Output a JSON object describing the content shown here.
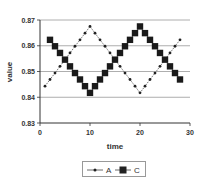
{
  "chart_data": {
    "type": "line",
    "title": "",
    "xlabel": "time",
    "ylabel": "value",
    "xlim": [
      0,
      30
    ],
    "ylim": [
      0.83,
      0.87
    ],
    "xticks": [
      0,
      10,
      20,
      30
    ],
    "yticks": [
      0.83,
      0.84,
      0.85,
      0.86,
      0.87
    ],
    "ytick_labels": [
      "0.83",
      "0.84",
      "0.85",
      "0.86",
      "0.87"
    ],
    "grid": "horizontal",
    "legend_position": "bottom",
    "series": [
      {
        "name": "A",
        "marker": "small-circle",
        "x": [
          1,
          2,
          3,
          4,
          5,
          6,
          7,
          8,
          9,
          10,
          11,
          12,
          13,
          14,
          15,
          16,
          17,
          18,
          19,
          20,
          21,
          22,
          23,
          24,
          25,
          26,
          27,
          28
        ],
        "values": [
          0.8443,
          0.8469,
          0.8494,
          0.852,
          0.8546,
          0.8572,
          0.8598,
          0.8623,
          0.8649,
          0.8675,
          0.8649,
          0.8623,
          0.8598,
          0.8572,
          0.8546,
          0.852,
          0.8494,
          0.8469,
          0.8443,
          0.8417,
          0.8443,
          0.8469,
          0.8494,
          0.852,
          0.8546,
          0.8572,
          0.8598,
          0.8623
        ]
      },
      {
        "name": "C",
        "marker": "large-square",
        "x": [
          2,
          3,
          4,
          5,
          6,
          7,
          8,
          9,
          10,
          11,
          12,
          13,
          14,
          15,
          16,
          17,
          18,
          19,
          20,
          21,
          22,
          23,
          24,
          25,
          26,
          27,
          28
        ],
        "values": [
          0.8623,
          0.8598,
          0.8572,
          0.8546,
          0.852,
          0.8494,
          0.8469,
          0.8443,
          0.8417,
          0.8443,
          0.8469,
          0.8494,
          0.852,
          0.8546,
          0.8572,
          0.8598,
          0.8623,
          0.8649,
          0.8675,
          0.8649,
          0.8623,
          0.8598,
          0.8572,
          0.8546,
          0.852,
          0.8494,
          0.8469
        ]
      }
    ]
  },
  "legend": {
    "a_label": "A",
    "c_label": "C"
  }
}
